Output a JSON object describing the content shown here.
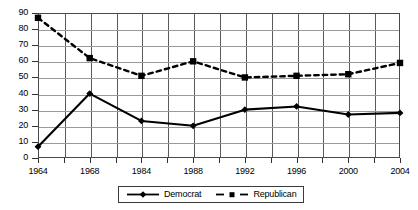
{
  "chart_data": {
    "type": "line",
    "title": "",
    "xlabel": "",
    "ylabel": "",
    "ylim": [
      0,
      90
    ],
    "ytick_step": 10,
    "yticks": [
      "0",
      "10",
      "20",
      "30",
      "40",
      "50",
      "60",
      "70",
      "80",
      "90"
    ],
    "categories": [
      "1964",
      "1968",
      "1984",
      "1988",
      "1992",
      "1996",
      "2000",
      "2004"
    ],
    "xticks_labeled": [
      "1964",
      "1968",
      "1984",
      "1988",
      "1992",
      "1996",
      "2000",
      "2004"
    ],
    "grid": true,
    "legend_position": "bottom-center",
    "series": [
      {
        "name": "Democrat",
        "marker": "diamond",
        "linestyle": "solid",
        "color": "#000000",
        "values": [
          7,
          40,
          23,
          20,
          30,
          32,
          27,
          28
        ]
      },
      {
        "name": "Republican",
        "marker": "square",
        "linestyle": "dashed",
        "color": "#000000",
        "values": [
          87,
          62,
          51,
          60,
          50,
          51,
          52,
          59
        ]
      }
    ]
  },
  "legend": {
    "democrat_label": "Democrat",
    "republican_label": "Republican"
  },
  "colors": {
    "series_line": "#000000",
    "grid_major": "#5a5a5a",
    "grid_minor": "#9a9a9a",
    "frame": "#4a4a4a",
    "background": "#ffffff"
  }
}
